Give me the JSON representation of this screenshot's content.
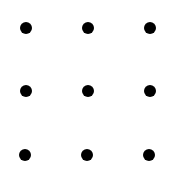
{
  "diagram": {
    "type": "dot-grid",
    "rows": 3,
    "cols": 3,
    "dot_color": "#000000",
    "background": "#ffffff",
    "dot_diameter": 12,
    "dots": [
      {
        "row": 1,
        "col": 1,
        "x": 26,
        "y": 28
      },
      {
        "row": 1,
        "col": 2,
        "x": 88,
        "y": 28
      },
      {
        "row": 1,
        "col": 3,
        "x": 150,
        "y": 28
      },
      {
        "row": 2,
        "col": 1,
        "x": 26,
        "y": 91
      },
      {
        "row": 2,
        "col": 2,
        "x": 88,
        "y": 91
      },
      {
        "row": 2,
        "col": 3,
        "x": 150,
        "y": 91
      },
      {
        "row": 3,
        "col": 1,
        "x": 25,
        "y": 155
      },
      {
        "row": 3,
        "col": 2,
        "x": 87,
        "y": 155
      },
      {
        "row": 3,
        "col": 3,
        "x": 149,
        "y": 155
      }
    ]
  }
}
